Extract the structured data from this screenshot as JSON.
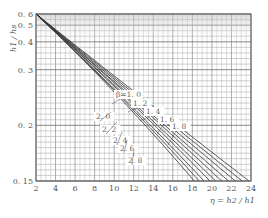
{
  "chart_data": {
    "type": "line",
    "title": "",
    "xlabel": "η = h2 / h1",
    "ylabel": "h1 / hs",
    "xlim": [
      2,
      24
    ],
    "ylim": [
      0.15,
      0.6
    ],
    "y_scale": "reciprocal",
    "grid": true,
    "x_ticks": [
      "2",
      "4",
      "6",
      "8",
      "10",
      "12",
      "14",
      "16",
      "18",
      "20",
      "22",
      "24"
    ],
    "y_ticks": [
      "0. 6",
      "0. 5",
      "0. 4",
      "0. 3",
      "0. 2",
      "0. 15"
    ],
    "y_tick_values": [
      0.6,
      0.5,
      0.4,
      0.3,
      0.2,
      0.15
    ],
    "x_tick_values": [
      2,
      4,
      6,
      8,
      10,
      12,
      14,
      16,
      18,
      20,
      22,
      24
    ],
    "series": [
      {
        "name": "β=1.0",
        "label": "β=1. 0",
        "x": [
          2,
          9.2,
          23.8
        ],
        "y": [
          0.6,
          0.3,
          0.15
        ]
      },
      {
        "name": "β=1.2",
        "label": "1. 2",
        "x": [
          2,
          9.0,
          23.1
        ],
        "y": [
          0.6,
          0.3,
          0.15
        ]
      },
      {
        "name": "β=1.4",
        "label": "1. 4",
        "x": [
          2,
          8.8,
          22.4
        ],
        "y": [
          0.6,
          0.3,
          0.15
        ]
      },
      {
        "name": "β=1.6",
        "label": "1. 6",
        "x": [
          2,
          8.6,
          21.7
        ],
        "y": [
          0.6,
          0.3,
          0.15
        ]
      },
      {
        "name": "β=1.8",
        "label": "1. 8",
        "x": [
          2,
          8.5,
          21.0
        ],
        "y": [
          0.6,
          0.3,
          0.15
        ]
      },
      {
        "name": "β=2.0",
        "label": "2. 0",
        "x": [
          2,
          8.3,
          20.4
        ],
        "y": [
          0.6,
          0.3,
          0.15
        ]
      },
      {
        "name": "β=2.2",
        "label": "2. 2",
        "x": [
          2,
          8.2,
          19.8
        ],
        "y": [
          0.6,
          0.3,
          0.15
        ]
      },
      {
        "name": "β=2.4",
        "label": "2. 4",
        "x": [
          2,
          8.0,
          19.2
        ],
        "y": [
          0.6,
          0.3,
          0.15
        ]
      },
      {
        "name": "β=2.6",
        "label": "2. 6",
        "x": [
          2,
          7.9,
          18.7
        ],
        "y": [
          0.6,
          0.3,
          0.15
        ]
      },
      {
        "name": "β=2.8",
        "label": "2. 8",
        "x": [
          2,
          7.8,
          18.2
        ],
        "y": [
          0.6,
          0.3,
          0.15
        ]
      }
    ]
  }
}
